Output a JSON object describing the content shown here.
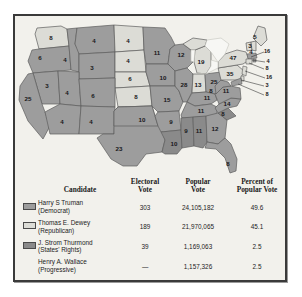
{
  "map": {
    "lakes_label": "great-lakes",
    "states": [
      {
        "code": "WA",
        "name": "Washington",
        "ev": "8",
        "winner": "dewey",
        "x": 36,
        "y": 22
      },
      {
        "code": "OR",
        "name": "Oregon",
        "ev": "6",
        "winner": "truman",
        "x": 25,
        "y": 42
      },
      {
        "code": "ID",
        "name": "Idaho",
        "ev": "4",
        "winner": "truman",
        "x": 50,
        "y": 44
      },
      {
        "code": "MT",
        "name": "Montana",
        "ev": "4",
        "winner": "truman",
        "x": 79,
        "y": 25
      },
      {
        "code": "WY",
        "name": "Wyoming",
        "ev": "3",
        "winner": "truman",
        "x": 77,
        "y": 52
      },
      {
        "code": "ND",
        "name": "North Dakota",
        "ev": "4",
        "winner": "dewey",
        "x": 113,
        "y": 25
      },
      {
        "code": "SD",
        "name": "South Dakota",
        "ev": "4",
        "winner": "dewey",
        "x": 113,
        "y": 45
      },
      {
        "code": "NE",
        "name": "Nebraska",
        "ev": "6",
        "winner": "dewey",
        "x": 115,
        "y": 63
      },
      {
        "code": "KS",
        "name": "Kansas",
        "ev": "8",
        "winner": "dewey",
        "x": 121,
        "y": 81
      },
      {
        "code": "CA",
        "name": "California",
        "ev": "25",
        "winner": "truman",
        "x": 13,
        "y": 83
      },
      {
        "code": "NV",
        "name": "Nevada",
        "ev": "3",
        "winner": "truman",
        "x": 32,
        "y": 70
      },
      {
        "code": "UT",
        "name": "Utah",
        "ev": "4",
        "winner": "truman",
        "x": 52,
        "y": 77
      },
      {
        "code": "CO",
        "name": "Colorado",
        "ev": "6",
        "winner": "truman",
        "x": 78,
        "y": 80
      },
      {
        "code": "AZ",
        "name": "Arizona",
        "ev": "4",
        "winner": "truman",
        "x": 47,
        "y": 106
      },
      {
        "code": "NM",
        "name": "New Mexico",
        "ev": "4",
        "winner": "truman",
        "x": 76,
        "y": 106
      },
      {
        "code": "TX",
        "name": "Texas",
        "ev": "23",
        "winner": "truman",
        "x": 104,
        "y": 133
      },
      {
        "code": "OK",
        "name": "Oklahoma",
        "ev": "10",
        "winner": "truman",
        "x": 127,
        "y": 104
      },
      {
        "code": "MN",
        "name": "Minnesota",
        "ev": "11",
        "winner": "truman",
        "x": 142,
        "y": 37
      },
      {
        "code": "IA",
        "name": "Iowa",
        "ev": "10",
        "winner": "truman",
        "x": 148,
        "y": 62
      },
      {
        "code": "MO",
        "name": "Missouri",
        "ev": "15",
        "winner": "truman",
        "x": 152,
        "y": 84
      },
      {
        "code": "AR",
        "name": "Arkansas",
        "ev": "9",
        "winner": "truman",
        "x": 156,
        "y": 106
      },
      {
        "code": "LA",
        "name": "Louisiana",
        "ev": "10",
        "winner": "thurmond",
        "x": 159,
        "y": 128
      },
      {
        "code": "WI",
        "name": "Wisconsin",
        "ev": "12",
        "winner": "truman",
        "x": 166,
        "y": 39
      },
      {
        "code": "IL",
        "name": "Illinois",
        "ev": "28",
        "winner": "truman",
        "x": 169,
        "y": 69
      },
      {
        "code": "MI",
        "name": "Michigan",
        "ev": "19",
        "winner": "dewey",
        "x": 186,
        "y": 46
      },
      {
        "code": "IN",
        "name": "Indiana",
        "ev": "13",
        "winner": "dewey",
        "x": 183,
        "y": 69
      },
      {
        "code": "OH",
        "name": "Ohio",
        "ev": "25",
        "winner": "truman",
        "x": 199,
        "y": 66
      },
      {
        "code": "KY",
        "name": "Kentucky",
        "ev": "11",
        "winner": "truman",
        "x": 192,
        "y": 82
      },
      {
        "code": "TN",
        "name": "Tennessee",
        "ev": "11",
        "winner": "truman",
        "x": 186,
        "y": 95
      },
      {
        "code": "MS",
        "name": "Mississippi",
        "ev": "9",
        "winner": "thurmond",
        "x": 171,
        "y": 115
      },
      {
        "code": "AL",
        "name": "Alabama",
        "ev": "11",
        "winner": "thurmond",
        "x": 184,
        "y": 115
      },
      {
        "code": "GA",
        "name": "Georgia",
        "ev": "12",
        "winner": "truman",
        "x": 200,
        "y": 113
      },
      {
        "code": "FL",
        "name": "Florida",
        "ev": "8",
        "winner": "truman",
        "x": 213,
        "y": 148
      },
      {
        "code": "SC",
        "name": "South Carolina",
        "ev": "8",
        "winner": "thurmond",
        "x": 208,
        "y": 98
      },
      {
        "code": "NC",
        "name": "North Carolina",
        "ev": "14",
        "winner": "truman",
        "x": 212,
        "y": 88
      },
      {
        "code": "VA",
        "name": "Virginia",
        "ev": "11",
        "winner": "truman",
        "x": 211,
        "y": 75
      },
      {
        "code": "WV",
        "name": "West Virginia",
        "ev": "8",
        "winner": "truman",
        "x": 196,
        "y": 75
      },
      {
        "code": "PA",
        "name": "Pennsylvania",
        "ev": "35",
        "winner": "dewey",
        "x": 215,
        "y": 58
      },
      {
        "code": "NY",
        "name": "New York",
        "ev": "47",
        "winner": "dewey",
        "x": 218,
        "y": 42
      },
      {
        "code": "VT",
        "name": "Vermont",
        "ev": "3",
        "winner": "dewey",
        "x": 235,
        "y": 30
      },
      {
        "code": "NH",
        "name": "New Hampshire",
        "ev": "4",
        "winner": "dewey",
        "x": 236,
        "y": 36
      },
      {
        "code": "ME",
        "name": "Maine",
        "ev": "5",
        "winner": "dewey",
        "x": 240,
        "y": 21
      }
    ],
    "callouts": [
      {
        "code": "MA",
        "name": "Massachusetts",
        "ev": "16",
        "winner": "truman",
        "lx": 252,
        "ly": 36,
        "ax": 236,
        "ay": 41
      },
      {
        "code": "RI",
        "name": "Rhode Island",
        "ev": "4",
        "winner": "truman",
        "lx": 253,
        "ly": 46,
        "ax": 237,
        "ay": 44
      },
      {
        "code": "CT",
        "name": "Connecticut",
        "ev": "8",
        "winner": "dewey",
        "lx": 252,
        "ly": 53,
        "ax": 234,
        "ay": 47
      },
      {
        "code": "NJ",
        "name": "New Jersey",
        "ev": "16",
        "winner": "dewey",
        "lx": 254,
        "ly": 62,
        "ax": 230,
        "ay": 55
      },
      {
        "code": "DE",
        "name": "Delaware",
        "ev": "3",
        "winner": "dewey",
        "lx": 252,
        "ly": 70,
        "ax": 226,
        "ay": 64
      },
      {
        "code": "MD",
        "name": "Maryland",
        "ev": "8",
        "winner": "truman",
        "lx": 252,
        "ly": 79,
        "ax": 223,
        "ay": 68
      }
    ]
  },
  "table": {
    "headers": {
      "candidate": "Candidate",
      "electoral_vote_line1": "Electoral",
      "electoral_vote_line2": "Vote",
      "popular_vote_line1": "Popular",
      "popular_vote_line2": "Vote",
      "percent_line1": "Percent of",
      "percent_line2": "Popular Vote"
    },
    "rows": [
      {
        "name": "Harry S Truman",
        "party": "(Democrat)",
        "electoral_vote": "303",
        "popular_vote": "24,105,182",
        "percent": "49.6",
        "swatch": "#9d9d9d",
        "swatch_name": "swatch-truman"
      },
      {
        "name": "Thomas E. Dewey",
        "party": "(Republican)",
        "electoral_vote": "189",
        "popular_vote": "21,970,065",
        "percent": "45.1",
        "swatch": "#dcdcd6",
        "swatch_name": "swatch-dewey"
      },
      {
        "name": "J. Strom Thurmond",
        "party": "(States' Rights)",
        "electoral_vote": "39",
        "popular_vote": "1,169,063",
        "percent": "2.5",
        "swatch": "#8a8a8a",
        "swatch_name": "swatch-thurmond"
      },
      {
        "name": "Henry A. Wallace",
        "party": "(Progressive)",
        "electoral_vote": "—",
        "popular_vote": "1,157,326",
        "percent": "2.5",
        "swatch": null,
        "swatch_name": "swatch-wallace-none"
      }
    ]
  },
  "colors": {
    "truman": "#9d9d9d",
    "dewey": "#dcdcd6",
    "thurmond": "#8a8a8a",
    "lakes": "#f7f7f4",
    "border": "#5d5d5d",
    "frame": "#3a3a3a",
    "page_bg": "#f2f1ec"
  }
}
